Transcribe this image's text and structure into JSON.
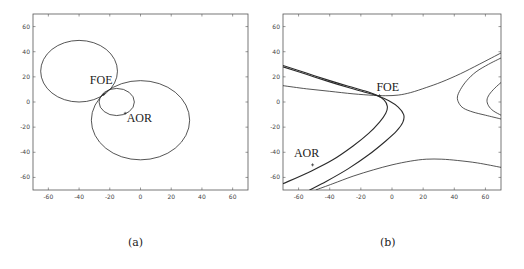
{
  "chart_data": [
    {
      "type": "line",
      "panel": "a",
      "caption": "(a)",
      "title": "",
      "xlabel": "",
      "ylabel": "",
      "xlim": [
        -70,
        70
      ],
      "ylim": [
        -70,
        70
      ],
      "grid": false,
      "xticks": [
        -60,
        -40,
        -20,
        0,
        20,
        40,
        60
      ],
      "yticks": [
        60,
        40,
        20,
        0,
        -20,
        -40,
        -60
      ],
      "series": [
        {
          "name": "circle-upper-left",
          "shape": "ellipse",
          "cx": -40,
          "cy": 24.5,
          "rx": 25,
          "ry": 24.5
        },
        {
          "name": "circle-small",
          "shape": "ellipse",
          "cx": -15.5,
          "cy": 0,
          "rx": 11.5,
          "ry": 10.8
        },
        {
          "name": "circle-lower-right",
          "shape": "ellipse",
          "cx": 0,
          "cy": -14.5,
          "rx": 32,
          "ry": 31.5
        }
      ],
      "annotations": [
        {
          "text": "FOE",
          "x": -33,
          "y": 14,
          "marker": [
            -24,
            6
          ]
        },
        {
          "text": "AOR",
          "x": -9,
          "y": -16,
          "marker": [
            -10,
            -9
          ]
        }
      ],
      "frame": {
        "left": 33,
        "right": 248,
        "top": 14,
        "bottom": 190
      }
    },
    {
      "type": "line",
      "panel": "b",
      "caption": "(b)",
      "title": "",
      "xlabel": "",
      "ylabel": "",
      "xlim": [
        -70,
        70
      ],
      "ylim": [
        -70,
        70
      ],
      "grid": false,
      "xticks": [
        -60,
        -40,
        -20,
        0,
        20,
        40,
        60
      ],
      "yticks": [
        60,
        40,
        20,
        0,
        -20,
        -40,
        -60
      ],
      "series": [
        {
          "name": "upper-branch",
          "width": 0.8,
          "points": [
            [
              -70,
              13
            ],
            [
              -55,
              10.5
            ],
            [
              -40,
              8.5
            ],
            [
              -25,
              6.5
            ],
            [
              -12,
              5.3
            ],
            [
              -4,
              5
            ],
            [
              4,
              5.5
            ],
            [
              12,
              7.5
            ],
            [
              22,
              11.5
            ],
            [
              32,
              16
            ],
            [
              44,
              22.5
            ],
            [
              56,
              30
            ],
            [
              70,
              39
            ]
          ]
        },
        {
          "name": "inner-vertex-curve",
          "width": 1.1,
          "points": [
            [
              -70,
              29
            ],
            [
              -55,
              23
            ],
            [
              -40,
              17
            ],
            [
              -28,
              12.5
            ],
            [
              -18,
              9
            ],
            [
              -10,
              5.5
            ],
            [
              -5,
              1.5
            ],
            [
              -3,
              -3.5
            ],
            [
              -4,
              -9
            ],
            [
              -8,
              -16
            ],
            [
              -15,
              -25
            ],
            [
              -25,
              -35
            ],
            [
              -38,
              -46
            ],
            [
              -52,
              -55
            ],
            [
              -70,
              -65
            ]
          ]
        },
        {
          "name": "outer-vertex-curve",
          "width": 1.1,
          "points": [
            [
              -70,
              28
            ],
            [
              -55,
              22
            ],
            [
              -40,
              16
            ],
            [
              -28,
              11.5
            ],
            [
              -18,
              8
            ],
            [
              -9,
              4.8
            ],
            [
              -2,
              1
            ],
            [
              4,
              -4
            ],
            [
              7.5,
              -10
            ],
            [
              7,
              -16
            ],
            [
              3,
              -23
            ],
            [
              -4,
              -31
            ],
            [
              -15,
              -42
            ],
            [
              -28,
              -53
            ],
            [
              -42,
              -63
            ],
            [
              -53,
              -70
            ]
          ]
        },
        {
          "name": "lower-branch",
          "width": 0.8,
          "points": [
            [
              -49,
              -70
            ],
            [
              -38,
              -65
            ],
            [
              -25,
              -59
            ],
            [
              -12,
              -54
            ],
            [
              0,
              -50
            ],
            [
              12,
              -47
            ],
            [
              22,
              -45.5
            ],
            [
              32,
              -45.5
            ],
            [
              42,
              -46.5
            ],
            [
              55,
              -48.5
            ],
            [
              70,
              -52
            ]
          ]
        },
        {
          "name": "right-outer-curve",
          "width": 0.8,
          "points": [
            [
              70,
              35
            ],
            [
              62,
              30
            ],
            [
              54,
              24
            ],
            [
              48,
              17
            ],
            [
              44,
              10
            ],
            [
              42,
              4
            ],
            [
              43,
              -1
            ],
            [
              46,
              -5
            ],
            [
              52,
              -8
            ],
            [
              60,
              -10.5
            ],
            [
              70,
              -13.5
            ]
          ]
        },
        {
          "name": "right-inner-curve",
          "width": 0.8,
          "points": [
            [
              70,
              15.5
            ],
            [
              66,
              11
            ],
            [
              62.5,
              6
            ],
            [
              61,
              1.5
            ],
            [
              62,
              -3
            ],
            [
              65,
              -7
            ],
            [
              70,
              -10.5
            ]
          ]
        }
      ],
      "annotations": [
        {
          "text": "FOE",
          "x": -10,
          "y": 9,
          "marker": [
            -8,
            5
          ]
        },
        {
          "text": "AOR",
          "x": -63,
          "y": -44,
          "marker": [
            -51,
            -50
          ]
        }
      ],
      "frame": {
        "left": 283,
        "right": 501,
        "top": 14,
        "bottom": 190
      }
    }
  ],
  "captions": {
    "a": "(a)",
    "b": "(b)"
  },
  "colors": {
    "line": "#2a2a2a",
    "axis": "#555555",
    "background": "#ffffff"
  }
}
